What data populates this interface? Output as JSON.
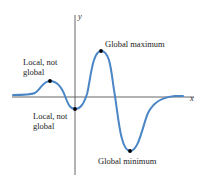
{
  "diagram": {
    "type": "function-extrema-graph",
    "axes": {
      "x_label": "x",
      "y_label": "y"
    },
    "annotations": [
      {
        "id": "local-max",
        "line1": "Local, not",
        "line2": "global"
      },
      {
        "id": "global-max",
        "line1": "Global maximum"
      },
      {
        "id": "local-min",
        "line1": "Local, not",
        "line2": "global"
      },
      {
        "id": "global-min",
        "line1": "Global minimum"
      }
    ],
    "colors": {
      "curve": "#4a86c5",
      "axis": "#555555",
      "point": "#000000",
      "text": "#222222"
    }
  }
}
